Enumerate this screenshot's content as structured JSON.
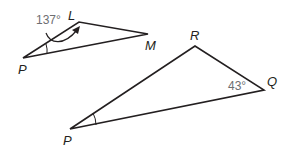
{
  "figure": {
    "triangle_small": {
      "vertices": {
        "P": "P",
        "L": "L",
        "M": "M"
      },
      "angle_label": "137°",
      "angle_at": "L"
    },
    "triangle_large": {
      "vertices": {
        "P": "P",
        "R": "R",
        "Q": "Q"
      },
      "angle_label": "43°",
      "angle_at": "Q"
    },
    "colors": {
      "stroke": "#231f20",
      "angle_text": "#6d6e71"
    }
  }
}
